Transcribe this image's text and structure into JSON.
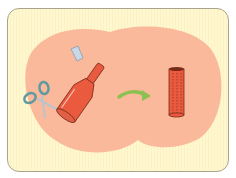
{
  "illustration": {
    "description": "Cutting a plastic bottle with scissors to make a cylinder",
    "colors": {
      "background": "#fef7cf",
      "blob": "#f9b99a",
      "bottle": "#e95a3f",
      "bottle_outline": "#7a2a1a",
      "cap": "#c9d7e6",
      "scissors": "#5e9aa0",
      "arrow": "#8cc152"
    },
    "elements": [
      "scissors-icon",
      "bottle-cap",
      "plastic-bottle",
      "arrow-right-icon",
      "cut-cylinder"
    ]
  }
}
